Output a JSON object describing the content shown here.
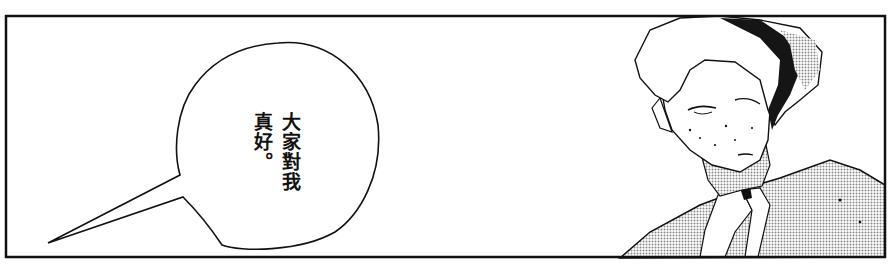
{
  "panel": {
    "speech_bubble": {
      "lines": [
        "大家對我",
        "真好。"
      ]
    },
    "colors": {
      "ink": "#111111",
      "paper": "#ffffff",
      "screentone": "#b8b8b8"
    }
  }
}
